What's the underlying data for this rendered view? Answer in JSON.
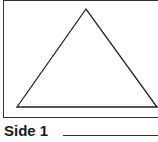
{
  "figure": {
    "shape": "triangle",
    "label": "Side 1",
    "stroke_color": "#222222"
  }
}
